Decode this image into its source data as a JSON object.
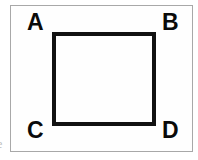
{
  "figure": {
    "background_color": "#ffffff",
    "frame": {
      "name": "figure-border",
      "color": "#a8a8a8",
      "fill": "#fefefe",
      "x": 10,
      "y": 5,
      "width": 183,
      "height": 147
    },
    "shape": {
      "type": "square",
      "name": "square-abcd",
      "stroke_color": "#111111",
      "stroke_width": 4,
      "fill": "none",
      "x": 52,
      "y": 32,
      "width": 104,
      "height": 94
    },
    "vertices": [
      {
        "id": "a",
        "label": "A",
        "position": "top-left",
        "x": 27,
        "y": 11
      },
      {
        "id": "b",
        "label": "B",
        "position": "top-right",
        "x": 162,
        "y": 11
      },
      {
        "id": "c",
        "label": "C",
        "position": "bottom-left",
        "x": 27,
        "y": 119
      },
      {
        "id": "d",
        "label": "D",
        "position": "bottom-right",
        "x": 162,
        "y": 119
      }
    ],
    "edge_artifact": {
      "text": "e",
      "color": "#9a9a9a"
    }
  }
}
